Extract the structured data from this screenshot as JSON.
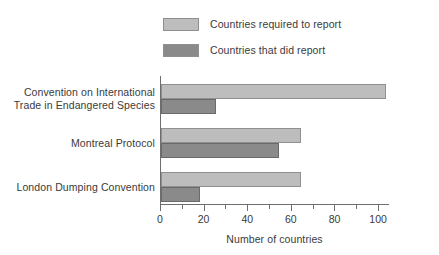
{
  "chart_data": {
    "type": "bar",
    "orientation": "horizontal",
    "title": "",
    "xlabel": "Number of countries",
    "ylabel": "",
    "xlim": [
      0,
      105
    ],
    "xticks": [
      0,
      20,
      40,
      60,
      80,
      100
    ],
    "xtick_labels": [
      "0",
      "20",
      "40",
      "60",
      "80",
      "100"
    ],
    "minor_tick_step": 10,
    "grid": false,
    "legend_position": "top",
    "categories": [
      "Convention on International Trade in Endangered Species",
      "Montreal Protocol",
      "London Dumping Convention"
    ],
    "category_label_lines": [
      [
        "Convention on International",
        "Trade in Endangered Species"
      ],
      [
        "Montreal Protocol"
      ],
      [
        "London Dumping Convention"
      ]
    ],
    "series": [
      {
        "name": "Countries required to report",
        "color": "#bdbdbd",
        "values": [
          103,
          64,
          64
        ]
      },
      {
        "name": "Countries that did report",
        "color": "#8a8a8a",
        "values": [
          25,
          54,
          18
        ]
      }
    ]
  },
  "legend": {
    "items": [
      {
        "label": "Countries required to report",
        "color": "#bdbdbd"
      },
      {
        "label": "Countries that did report",
        "color": "#8a8a8a"
      }
    ]
  },
  "axis": {
    "x_title": "Number of countries",
    "tick_labels": [
      "0",
      "20",
      "40",
      "60",
      "80",
      "100"
    ]
  }
}
